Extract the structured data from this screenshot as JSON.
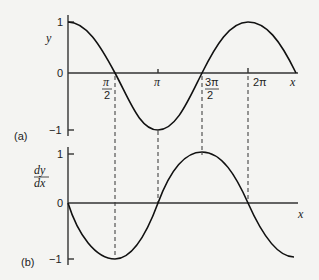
{
  "panel_a": {
    "label": "(a)",
    "y_axis_label": "y",
    "x_axis_label": "x",
    "y_ticks": [
      "1",
      "0",
      "−1"
    ],
    "x_ticks": [
      {
        "num": "π",
        "den": "2"
      },
      {
        "num": "π",
        "den": ""
      },
      {
        "num": "3π",
        "den": "2"
      },
      {
        "num": "2π",
        "den": ""
      }
    ],
    "curve": "y = cos x"
  },
  "panel_b": {
    "label": "(b)",
    "y_axis_label_num": "dy",
    "y_axis_label_den": "dx",
    "x_axis_label": "x",
    "y_ticks": [
      "1",
      "0",
      "−1"
    ],
    "curve": "dy/dx = −sin x"
  }
}
